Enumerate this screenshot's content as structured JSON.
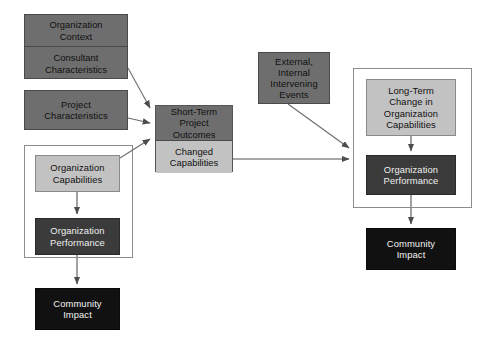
{
  "diagram": {
    "width": 498,
    "height": 344,
    "background": "#ffffff",
    "palette": {
      "medium_gray": "#6e6e6e",
      "light_gray": "#c2c2c2",
      "dark_gray": "#3b3b3b",
      "black": "#111111",
      "frame_border": "#8c8c8c",
      "arrow": "#555555"
    }
  },
  "nodes": {
    "organization_context": {
      "label": "Organization\nContext",
      "fill": "medium_gray",
      "x": 24,
      "y": 14,
      "w": 104,
      "h": 32
    },
    "consultant_characteristics": {
      "label": "Consultant\nCharacteristics",
      "fill": "medium_gray",
      "x": 24,
      "y": 46,
      "w": 104,
      "h": 33
    },
    "project_characteristics": {
      "label": "Project\nCharacteristics",
      "fill": "medium_gray",
      "x": 24,
      "y": 90,
      "w": 104,
      "h": 40
    },
    "organization_capabilities_left": {
      "label": "Organization\nCapabilities",
      "fill": "light_gray",
      "x": 35,
      "y": 155,
      "w": 85,
      "h": 37
    },
    "organization_performance_left": {
      "label": "Organization\nPerformance",
      "fill": "dark_gray",
      "x": 35,
      "y": 218,
      "w": 85,
      "h": 37
    },
    "community_impact_left": {
      "label": "Community\nImpact",
      "fill": "black",
      "x": 35,
      "y": 288,
      "w": 85,
      "h": 42
    },
    "short_term_project_outcomes": {
      "label": "Short-Term Project\nOutcomes",
      "fill": "medium_gray",
      "x": 155,
      "y": 105,
      "w": 78,
      "h": 35
    },
    "changed_capabilities": {
      "label": "Changed\nCapabilities",
      "fill": "light_gray",
      "x": 155,
      "y": 140,
      "w": 78,
      "h": 32
    },
    "external_internal_intervening_events": {
      "label": "External,\nInternal\nIntervening\nEvents",
      "fill": "medium_gray",
      "x": 258,
      "y": 52,
      "w": 72,
      "h": 52
    },
    "long_term_change": {
      "label": "Long-Term\nChange in\nOrganization\nCapabilities",
      "fill": "light_gray",
      "x": 366,
      "y": 79,
      "w": 90,
      "h": 57
    },
    "organization_performance_right": {
      "label": "Organization\nPerformance",
      "fill": "dark_gray",
      "x": 366,
      "y": 155,
      "w": 90,
      "h": 40
    },
    "community_impact_right": {
      "label": "Community\nImpact",
      "fill": "black",
      "x": 366,
      "y": 228,
      "w": 90,
      "h": 42
    }
  },
  "frames": {
    "left_group": {
      "x": 24,
      "y": 145,
      "w": 109,
      "h": 113
    },
    "right_group": {
      "x": 353,
      "y": 68,
      "w": 119,
      "h": 140
    }
  },
  "edges": [
    {
      "from": "consultant_characteristics",
      "to": "short_term_project_outcomes"
    },
    {
      "from": "project_characteristics",
      "to": "short_term_project_outcomes"
    },
    {
      "from": "organization_capabilities_left",
      "to": "short_term_project_outcomes"
    },
    {
      "from": "organization_capabilities_left",
      "to": "organization_performance_left"
    },
    {
      "from": "organization_performance_left",
      "to": "community_impact_left"
    },
    {
      "from": "changed_capabilities",
      "to": "right_group"
    },
    {
      "from": "external_internal_intervening_events",
      "to": "right_group"
    },
    {
      "from": "long_term_change",
      "to": "organization_performance_right"
    },
    {
      "from": "organization_performance_right",
      "to": "community_impact_right"
    }
  ]
}
